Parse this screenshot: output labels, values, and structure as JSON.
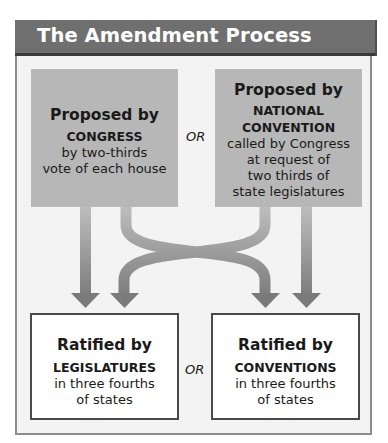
{
  "title": "The Amendment Process",
  "proposal": [
    {
      "lead": "Proposed by",
      "body_caps": [
        "CONGRESS"
      ],
      "body": [
        "by two-thirds",
        "vote of each house"
      ]
    },
    {
      "lead": "Proposed by",
      "body_caps": [
        "NATIONAL",
        "CONVENTION"
      ],
      "body": [
        "called by Congress",
        "at request of",
        "two thirds of",
        "state legislatures"
      ]
    }
  ],
  "ratification": [
    {
      "lead": "Ratified by",
      "body_caps": [
        "LEGISLATURES"
      ],
      "body": [
        "in three fourths",
        "of states"
      ]
    },
    {
      "lead": "Ratified by",
      "body_caps": [
        "CONVENTIONS"
      ],
      "body": [
        "in three fourths",
        "of states"
      ]
    }
  ],
  "connectors": {
    "top_or": "OR",
    "bottom_or": "OR"
  },
  "colors": {
    "header_bg": "#6f6f6f",
    "proposal_box": "#b7b7b7",
    "arrow": "#8e8e8e",
    "frame_bg": "#f3f3f3"
  }
}
